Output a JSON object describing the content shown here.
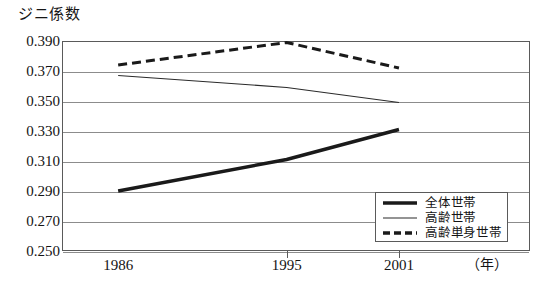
{
  "chart_data": {
    "type": "line",
    "title": "ジニ係数",
    "xlabel": "（年）",
    "ylabel": "ジニ係数",
    "x": [
      1986,
      1995,
      2001
    ],
    "xtick_labels": [
      "1986",
      "1995",
      "2001"
    ],
    "ytick_labels": [
      "0.390",
      "0.370",
      "0.350",
      "0.330",
      "0.310",
      "0.290",
      "0.270",
      "0.250"
    ],
    "ytick_values": [
      0.39,
      0.37,
      0.35,
      0.33,
      0.31,
      0.29,
      0.27,
      0.25
    ],
    "ylim": [
      0.25,
      0.39
    ],
    "xlim": [
      1983,
      2008
    ],
    "grid": "horizontal",
    "legend_position": "lower-right-inside",
    "series": [
      {
        "name": "全体世帯",
        "style": "thick-solid",
        "color": "#1a1a1a",
        "width": 3.4,
        "values": [
          0.29,
          0.311,
          0.331
        ]
      },
      {
        "name": "高齢世帯",
        "style": "thin-solid",
        "color": "#2a2a2a",
        "width": 1.1,
        "values": [
          0.367,
          0.359,
          0.349
        ]
      },
      {
        "name": "高齢単身世帯",
        "style": "dashed",
        "color": "#1a1a1a",
        "width": 3.0,
        "values": [
          0.374,
          0.389,
          0.372
        ]
      }
    ]
  },
  "legend": {
    "items": [
      {
        "label": "全体世帯",
        "style": "thick-solid"
      },
      {
        "label": "高齢世帯",
        "style": "thin-solid"
      },
      {
        "label": "高齢単身世帯",
        "style": "dashed"
      }
    ]
  },
  "colors": {
    "frame": "#5a5a5a",
    "grid": "#8c8c8c",
    "ink": "#141414",
    "background": "#ffffff"
  }
}
